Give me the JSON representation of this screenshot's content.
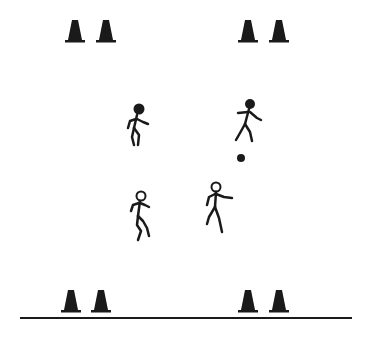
{
  "diagram": {
    "description": "Soccer drill: four players between two rows of cones, one player dribbling a ball",
    "colors": {
      "ink": "#1a1a1a",
      "background": "#ffffff"
    },
    "cones": [
      {
        "id": "cone-top-1",
        "x": 75,
        "y": 42
      },
      {
        "id": "cone-top-2",
        "x": 106,
        "y": 42
      },
      {
        "id": "cone-top-3",
        "x": 248,
        "y": 42
      },
      {
        "id": "cone-top-4",
        "x": 279,
        "y": 42
      },
      {
        "id": "cone-bottom-1",
        "x": 71,
        "y": 312
      },
      {
        "id": "cone-bottom-2",
        "x": 101,
        "y": 312
      },
      {
        "id": "cone-bottom-3",
        "x": 248,
        "y": 312
      },
      {
        "id": "cone-bottom-4",
        "x": 279,
        "y": 312
      }
    ],
    "players": [
      {
        "id": "player-1",
        "team": "filled",
        "head_x": 139,
        "head_y": 110
      },
      {
        "id": "player-2",
        "team": "filled",
        "head_x": 250,
        "head_y": 105,
        "has_ball": true
      },
      {
        "id": "player-3",
        "team": "open",
        "head_x": 141,
        "head_y": 196
      },
      {
        "id": "player-4",
        "team": "open",
        "head_x": 216,
        "head_y": 188
      }
    ],
    "ball": {
      "x": 241,
      "y": 158
    },
    "baseline": {
      "x1": 20,
      "y1": 318,
      "x2": 352,
      "y2": 318
    }
  }
}
